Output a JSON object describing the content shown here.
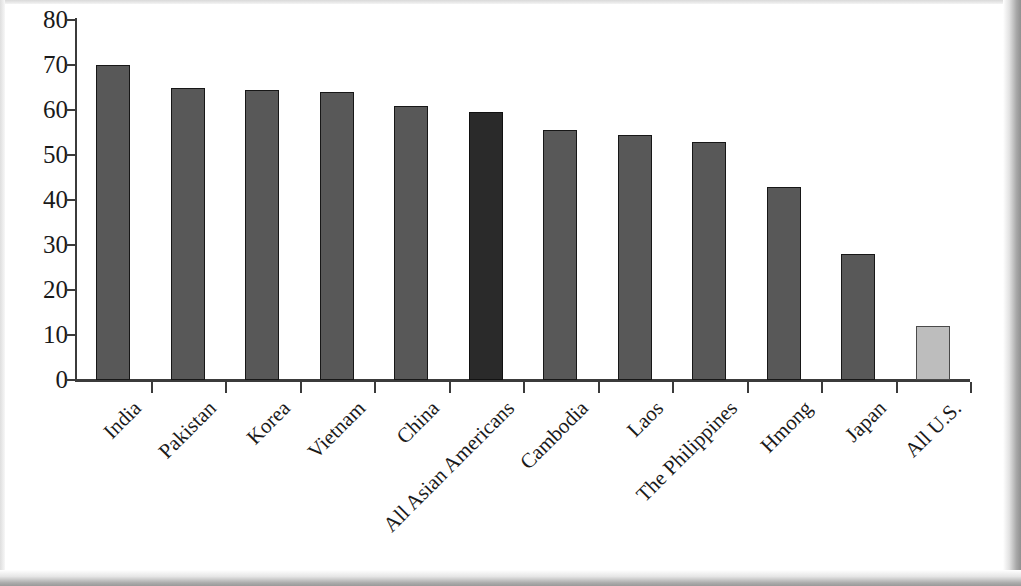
{
  "chart_data": {
    "type": "bar",
    "title": "",
    "xlabel": "",
    "ylabel": "",
    "ylim": [
      0,
      80
    ],
    "grid": false,
    "legend": "none",
    "y_ticks": [
      "0",
      "10",
      "20",
      "30",
      "40",
      "50",
      "60",
      "70",
      "80"
    ],
    "y_tick_values": [
      0,
      10,
      20,
      30,
      40,
      50,
      60,
      70,
      80
    ],
    "categories": [
      "India",
      "Pakistan",
      "Korea",
      "Vietnam",
      "China",
      "All Asian Americans",
      "Cambodia",
      "Laos",
      "The Philippines",
      "Hmong",
      "Japan",
      "All U.S."
    ],
    "values": [
      70,
      65,
      64.5,
      64,
      61,
      59.5,
      55.5,
      54.5,
      53,
      43,
      28,
      12
    ],
    "bar_styles": [
      "normal",
      "normal",
      "normal",
      "normal",
      "normal",
      "accent-dark",
      "normal",
      "normal",
      "normal",
      "normal",
      "normal",
      "accent-light"
    ]
  },
  "colors": {
    "bar_normal": "#585858",
    "bar_accent_dark": "#2a2a2a",
    "bar_accent_light": "#bdbdbd",
    "axis": "#3b3b3b",
    "text": "#1a1a1a",
    "background": "#ffffff"
  }
}
